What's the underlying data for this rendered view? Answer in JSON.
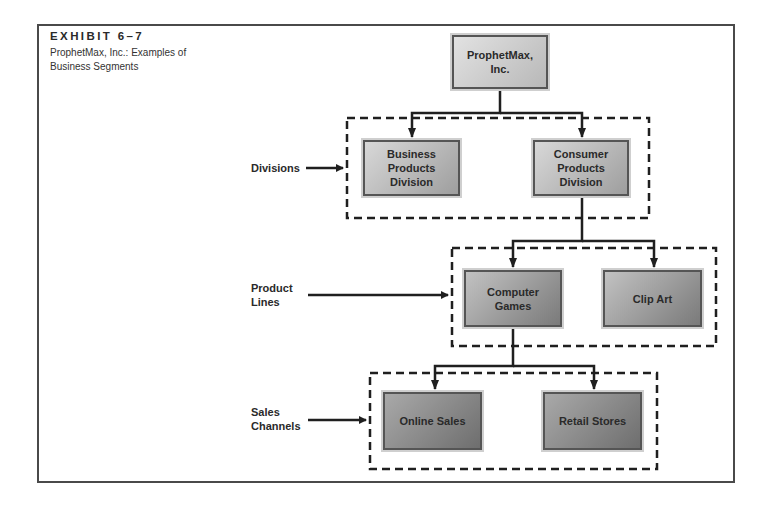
{
  "exhibit": {
    "label": "EXHIBIT 6–7",
    "title": "ProphetMax, Inc.: Examples of Business Segments"
  },
  "nodes": {
    "root": "ProphetMax, Inc.",
    "business_division": "Business Products Division",
    "consumer_division": "Consumer Products Division",
    "computer_games": "Computer Games",
    "clip_art": "Clip Art",
    "online_sales": "Online Sales",
    "retail_stores": "Retail Stores"
  },
  "side_labels": {
    "divisions": "Divisions",
    "product_lines": "Product Lines",
    "sales_channels": "Sales Channels"
  },
  "colors": {
    "frame": "#4a4a4a",
    "line": "#1f1f1f",
    "level0": "#cdcdcd",
    "level1": "#bbbbbb",
    "level2": "#9f9f9f",
    "level3": "#8c8c8c"
  }
}
